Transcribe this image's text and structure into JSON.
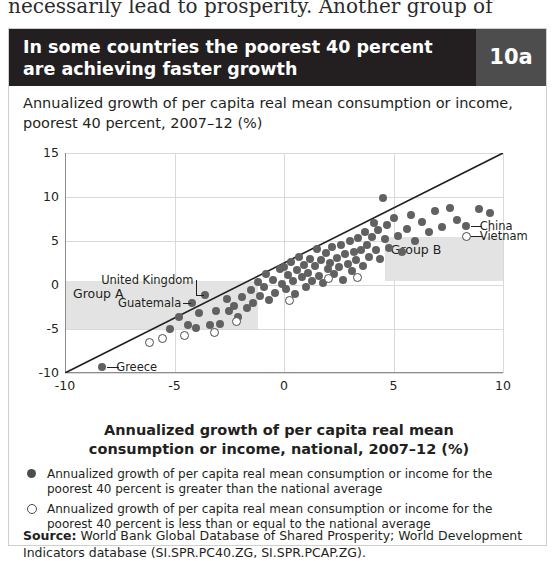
{
  "bleed_text": "necessarily lead to prosperity. Another group of",
  "header": {
    "title": "In some countries the poorest 40 percent are achieving faster growth",
    "number": "10a",
    "bg_color": "#231f20",
    "number_bg_color": "#4d4d4d"
  },
  "subtitle": "Annualized growth of per capita real mean consumption or income, poorest 40 percent, 2007–12 (%)",
  "legend": [
    {
      "marker": "filled-dot",
      "text": "Annualized growth of per capita real mean consumption or income for the poorest 40 percent is greater than the national average"
    },
    {
      "marker": "open-dot",
      "text": "Annualized growth of per capita real mean consumption or income for the poorest 40 percent is less than or equal to the national average"
    }
  ],
  "source": {
    "label": "Source:",
    "text": " World Bank Global Database of Shared Prosperity; World Development Indicators database (SI.SPR.PC40.ZG, SI.SPR.PCAP.ZG)."
  },
  "chart_data": {
    "type": "scatter",
    "title": "In some countries the poorest 40 percent are achieving faster growth",
    "ylabel": "Annualized growth of per capita real mean consumption or income, poorest 40 percent, 2007–12 (%)",
    "xlabel": "Annualized growth of per capita real mean consumption or income, national, 2007–12 (%)",
    "xlim": [
      -10,
      10
    ],
    "ylim": [
      -10,
      15
    ],
    "xticks": [
      -10,
      -5,
      0,
      5,
      10
    ],
    "yticks": [
      -10,
      -5,
      0,
      5,
      10,
      15
    ],
    "grid": "horizontal-and-vertical",
    "reference_line": {
      "type": "45-degree",
      "from": [
        -10,
        -10
      ],
      "to": [
        10,
        10
      ]
    },
    "shaded_regions": [
      {
        "label": "Group A",
        "x_range": [
          -10,
          -1.2
        ],
        "y_range": [
          -5,
          0.4
        ],
        "color": "#e3e3e3"
      },
      {
        "label": "Group B",
        "x_range": [
          4.6,
          10
        ],
        "y_range": [
          0.4,
          5.4
        ],
        "color": "#e3e3e3"
      }
    ],
    "annotations": [
      {
        "label": "Greece",
        "x": -8.3,
        "y": -9.3
      },
      {
        "label": "Guatemala",
        "x": -4.2,
        "y": -2.1
      },
      {
        "label": "United Kingdom",
        "x": -3.6,
        "y": -1.1
      },
      {
        "label": "China",
        "x": 8.3,
        "y": 6.7
      },
      {
        "label": "Vietnam",
        "x": 8.3,
        "y": 5.6
      }
    ],
    "points": [
      {
        "x": -8.3,
        "y": -9.3,
        "fill": "filled"
      },
      {
        "x": -5.2,
        "y": -5.0,
        "fill": "filled"
      },
      {
        "x": -4.8,
        "y": -3.6,
        "fill": "filled"
      },
      {
        "x": -4.4,
        "y": -4.6,
        "fill": "filled"
      },
      {
        "x": -4.2,
        "y": -2.1,
        "fill": "filled"
      },
      {
        "x": -4.0,
        "y": -4.9,
        "fill": "filled"
      },
      {
        "x": -3.9,
        "y": -3.2,
        "fill": "filled"
      },
      {
        "x": -3.6,
        "y": -1.1,
        "fill": "filled"
      },
      {
        "x": -3.4,
        "y": -4.6,
        "fill": "filled"
      },
      {
        "x": -3.1,
        "y": -3.0,
        "fill": "filled"
      },
      {
        "x": -2.9,
        "y": -4.4,
        "fill": "filled"
      },
      {
        "x": -2.6,
        "y": -1.6,
        "fill": "filled"
      },
      {
        "x": -2.5,
        "y": -3.0,
        "fill": "filled"
      },
      {
        "x": -2.3,
        "y": -2.4,
        "fill": "filled"
      },
      {
        "x": -2.1,
        "y": -3.6,
        "fill": "filled"
      },
      {
        "x": -1.9,
        "y": -1.4,
        "fill": "filled"
      },
      {
        "x": -1.7,
        "y": -2.6,
        "fill": "filled"
      },
      {
        "x": -1.5,
        "y": -0.6,
        "fill": "filled"
      },
      {
        "x": -1.4,
        "y": -2.1,
        "fill": "filled"
      },
      {
        "x": -1.2,
        "y": 0.3,
        "fill": "filled"
      },
      {
        "x": -1.1,
        "y": -1.2,
        "fill": "filled"
      },
      {
        "x": -0.9,
        "y": -0.2,
        "fill": "filled"
      },
      {
        "x": -0.8,
        "y": 1.2,
        "fill": "filled"
      },
      {
        "x": -0.7,
        "y": -1.7,
        "fill": "filled"
      },
      {
        "x": -0.5,
        "y": 0.6,
        "fill": "filled"
      },
      {
        "x": -0.4,
        "y": -0.9,
        "fill": "filled"
      },
      {
        "x": -0.2,
        "y": 1.8,
        "fill": "filled"
      },
      {
        "x": -0.1,
        "y": 0.1,
        "fill": "filled"
      },
      {
        "x": 0.0,
        "y": 2.0,
        "fill": "filled"
      },
      {
        "x": 0.1,
        "y": -0.5,
        "fill": "filled"
      },
      {
        "x": 0.2,
        "y": 1.1,
        "fill": "filled"
      },
      {
        "x": 0.3,
        "y": 2.6,
        "fill": "filled"
      },
      {
        "x": 0.4,
        "y": 0.4,
        "fill": "filled"
      },
      {
        "x": 0.5,
        "y": -1.0,
        "fill": "filled"
      },
      {
        "x": 0.6,
        "y": 1.7,
        "fill": "filled"
      },
      {
        "x": 0.7,
        "y": 3.2,
        "fill": "filled"
      },
      {
        "x": 0.8,
        "y": 0.9,
        "fill": "filled"
      },
      {
        "x": 0.9,
        "y": 2.3,
        "fill": "filled"
      },
      {
        "x": 1.0,
        "y": -0.2,
        "fill": "filled"
      },
      {
        "x": 1.1,
        "y": 1.4,
        "fill": "filled"
      },
      {
        "x": 1.2,
        "y": 3.0,
        "fill": "filled"
      },
      {
        "x": 1.3,
        "y": 0.5,
        "fill": "filled"
      },
      {
        "x": 1.4,
        "y": 2.2,
        "fill": "filled"
      },
      {
        "x": 1.5,
        "y": 4.1,
        "fill": "filled"
      },
      {
        "x": 1.6,
        "y": 1.0,
        "fill": "filled"
      },
      {
        "x": 1.7,
        "y": 2.8,
        "fill": "filled"
      },
      {
        "x": 1.8,
        "y": 0.2,
        "fill": "filled"
      },
      {
        "x": 1.9,
        "y": 3.6,
        "fill": "filled"
      },
      {
        "x": 2.0,
        "y": 1.8,
        "fill": "filled"
      },
      {
        "x": 2.1,
        "y": 2.5,
        "fill": "filled"
      },
      {
        "x": 2.2,
        "y": 4.3,
        "fill": "filled"
      },
      {
        "x": 2.3,
        "y": 1.2,
        "fill": "filled"
      },
      {
        "x": 2.4,
        "y": 3.1,
        "fill": "filled"
      },
      {
        "x": 2.5,
        "y": 2.0,
        "fill": "filled"
      },
      {
        "x": 2.6,
        "y": 4.6,
        "fill": "filled"
      },
      {
        "x": 2.7,
        "y": 0.6,
        "fill": "filled"
      },
      {
        "x": 2.8,
        "y": 3.5,
        "fill": "filled"
      },
      {
        "x": 2.9,
        "y": 2.4,
        "fill": "filled"
      },
      {
        "x": 3.0,
        "y": 5.0,
        "fill": "filled"
      },
      {
        "x": 3.1,
        "y": 1.6,
        "fill": "filled"
      },
      {
        "x": 3.2,
        "y": 3.8,
        "fill": "filled"
      },
      {
        "x": 3.3,
        "y": 2.8,
        "fill": "filled"
      },
      {
        "x": 3.4,
        "y": 5.3,
        "fill": "filled"
      },
      {
        "x": 3.5,
        "y": 4.0,
        "fill": "filled"
      },
      {
        "x": 3.6,
        "y": 2.2,
        "fill": "filled"
      },
      {
        "x": 3.7,
        "y": 6.0,
        "fill": "filled"
      },
      {
        "x": 3.8,
        "y": 4.5,
        "fill": "filled"
      },
      {
        "x": 3.9,
        "y": 3.2,
        "fill": "filled"
      },
      {
        "x": 4.0,
        "y": 5.5,
        "fill": "filled"
      },
      {
        "x": 4.1,
        "y": 7.0,
        "fill": "filled"
      },
      {
        "x": 4.2,
        "y": 4.0,
        "fill": "filled"
      },
      {
        "x": 4.3,
        "y": 6.2,
        "fill": "filled"
      },
      {
        "x": 4.4,
        "y": 3.0,
        "fill": "filled"
      },
      {
        "x": 4.5,
        "y": 9.9,
        "fill": "filled"
      },
      {
        "x": 4.6,
        "y": 5.2,
        "fill": "filled"
      },
      {
        "x": 4.7,
        "y": 6.8,
        "fill": "filled"
      },
      {
        "x": 4.8,
        "y": 4.2,
        "fill": "filled"
      },
      {
        "x": 5.0,
        "y": 7.6,
        "fill": "filled"
      },
      {
        "x": 5.2,
        "y": 5.6,
        "fill": "filled"
      },
      {
        "x": 5.4,
        "y": 3.8,
        "fill": "filled"
      },
      {
        "x": 5.6,
        "y": 6.4,
        "fill": "filled"
      },
      {
        "x": 5.8,
        "y": 8.0,
        "fill": "filled"
      },
      {
        "x": 6.0,
        "y": 5.0,
        "fill": "filled"
      },
      {
        "x": 6.3,
        "y": 7.2,
        "fill": "filled"
      },
      {
        "x": 6.6,
        "y": 6.0,
        "fill": "filled"
      },
      {
        "x": 6.9,
        "y": 8.4,
        "fill": "filled"
      },
      {
        "x": 7.2,
        "y": 6.6,
        "fill": "filled"
      },
      {
        "x": 7.6,
        "y": 8.8,
        "fill": "filled"
      },
      {
        "x": 7.9,
        "y": 7.4,
        "fill": "filled"
      },
      {
        "x": 8.3,
        "y": 6.7,
        "fill": "filled"
      },
      {
        "x": 8.3,
        "y": 5.6,
        "fill": "open"
      },
      {
        "x": 8.9,
        "y": 8.6,
        "fill": "filled"
      },
      {
        "x": 9.4,
        "y": 8.2,
        "fill": "filled"
      },
      {
        "x": -6.2,
        "y": -6.4,
        "fill": "open"
      },
      {
        "x": -5.6,
        "y": -6.0,
        "fill": "open"
      },
      {
        "x": -4.6,
        "y": -5.6,
        "fill": "open"
      },
      {
        "x": -3.2,
        "y": -5.3,
        "fill": "open"
      },
      {
        "x": -2.2,
        "y": -4.0,
        "fill": "open"
      },
      {
        "x": 0.2,
        "y": -1.6,
        "fill": "open"
      },
      {
        "x": 2.0,
        "y": 0.8,
        "fill": "open"
      },
      {
        "x": 3.3,
        "y": 1.0,
        "fill": "open"
      }
    ]
  },
  "axis": {
    "group_a_label": "Group A",
    "group_b_label": "Group B"
  }
}
